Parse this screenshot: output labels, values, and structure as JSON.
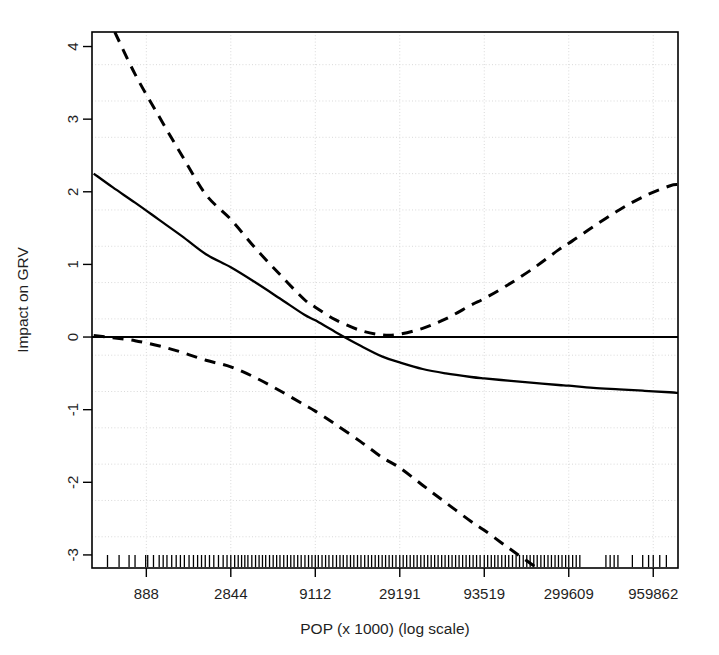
{
  "chart_data": {
    "type": "line",
    "title": "",
    "subtitle": "",
    "xlabel": "POP (x 1000) (log scale)",
    "ylabel": "Impact on GRV",
    "grid": true,
    "legend_position": "none",
    "x_scale": "log",
    "xtick_labels": [
      "888",
      "2844",
      "9112",
      "29191",
      "93519",
      "299609",
      "959862"
    ],
    "xtick_values": [
      888,
      2844,
      9112,
      29191,
      93519,
      299609,
      959862
    ],
    "ytick_labels": [
      "-3",
      "-2",
      "-1",
      "0",
      "1",
      "2",
      "3",
      "4"
    ],
    "ytick_values": [
      -3,
      -2,
      -1,
      0,
      1,
      2,
      3,
      4
    ],
    "xlim": [
      420,
      1350000
    ],
    "ylim": [
      -3.18,
      4.2
    ],
    "reference_line": {
      "orientation": "horizontal",
      "y": 0,
      "style": "solid",
      "color": "#000000"
    },
    "series": [
      {
        "name": "Smooth fit",
        "style": "solid",
        "color": "#000000",
        "x": [
          430,
          560,
          760,
          1050,
          1450,
          2020,
          2844,
          4000,
          5600,
          7800,
          9112,
          12000,
          17000,
          23000,
          29191,
          40000,
          55000,
          78000,
          93519,
          130000,
          185000,
          260000,
          299609,
          420000,
          600000,
          850000,
          1200000,
          1350000
        ],
        "y": [
          2.25,
          2.06,
          1.85,
          1.62,
          1.39,
          1.14,
          0.96,
          0.75,
          0.53,
          0.31,
          0.23,
          0.07,
          -0.12,
          -0.27,
          -0.35,
          -0.44,
          -0.5,
          -0.55,
          -0.57,
          -0.6,
          -0.63,
          -0.66,
          -0.67,
          -0.7,
          -0.72,
          -0.74,
          -0.76,
          -0.77
        ]
      },
      {
        "name": "Upper 95% confidence band",
        "style": "dashed",
        "color": "#000000",
        "x": [
          575,
          760,
          1050,
          1450,
          2020,
          2844,
          4000,
          5600,
          7800,
          9112,
          12000,
          17000,
          23000,
          29191,
          40000,
          55000,
          78000,
          93519,
          130000,
          185000,
          260000,
          299609,
          420000,
          600000,
          850000,
          1200000,
          1350000
        ],
        "y": [
          4.2,
          3.62,
          3.05,
          2.5,
          1.96,
          1.62,
          1.22,
          0.86,
          0.52,
          0.41,
          0.24,
          0.09,
          0.03,
          0.04,
          0.12,
          0.25,
          0.44,
          0.53,
          0.72,
          0.95,
          1.2,
          1.29,
          1.52,
          1.75,
          1.94,
          2.08,
          2.1
        ]
      },
      {
        "name": "Lower 95% confidence band",
        "style": "dashed",
        "color": "#000000",
        "x": [
          430,
          560,
          760,
          1050,
          1450,
          2020,
          2844,
          4000,
          5600,
          7800,
          9112,
          12000,
          17000,
          23000,
          29191,
          40000,
          55000,
          78000,
          93519,
          130000,
          185000,
          260000,
          299609,
          420000,
          600000,
          780000
        ],
        "y": [
          0.02,
          -0.01,
          -0.05,
          -0.12,
          -0.21,
          -0.32,
          -0.41,
          -0.56,
          -0.74,
          -0.93,
          -1.02,
          -1.2,
          -1.44,
          -1.66,
          -1.8,
          -2.04,
          -2.28,
          -2.54,
          -2.66,
          -2.9,
          -3.15,
          -3.4,
          -3.5,
          -3.8,
          -4.1,
          -4.3
        ]
      }
    ],
    "rug": {
      "name": "data-rug",
      "description": "tick marks showing observed POP values along the bottom axis",
      "values": [
        520,
        610,
        700,
        760,
        880,
        905,
        980,
        1060,
        1120,
        1180,
        1260,
        1340,
        1420,
        1500,
        1600,
        1700,
        1800,
        1900,
        2000,
        2120,
        2250,
        2400,
        2560,
        2700,
        2844,
        3000,
        3150,
        3300,
        3450,
        3600,
        3800,
        4000,
        4200,
        4400,
        4600,
        4850,
        5100,
        5350,
        5600,
        5900,
        6200,
        6500,
        6800,
        7150,
        7500,
        7900,
        8300,
        8700,
        9112,
        9500,
        10000,
        10500,
        11000,
        11600,
        12200,
        12800,
        13400,
        14100,
        14800,
        15500,
        16300,
        17100,
        18000,
        18900,
        19800,
        20800,
        21800,
        22900,
        24000,
        25200,
        26400,
        27700,
        29191,
        30600,
        32100,
        33700,
        35400,
        37100,
        39000,
        40900,
        42900,
        45000,
        47200,
        49500,
        52000,
        54500,
        57200,
        60000,
        63000,
        66100,
        69400,
        72800,
        76400,
        80200,
        84100,
        88300,
        93519,
        98000,
        103000,
        108000,
        113000,
        119000,
        125000,
        131000,
        138000,
        145000,
        152000,
        160000,
        168000,
        176000,
        185000,
        194000,
        204000,
        214000,
        225000,
        236000,
        248000,
        260000,
        273000,
        287000,
        299609,
        316000,
        332000,
        349000,
        500000,
        530000,
        560000,
        590000,
        720000,
        830000,
        900000,
        959862,
        1050000,
        1150000
      ]
    }
  },
  "figure": {
    "background_color": "#ffffff",
    "frame_color": "#000000",
    "grid_color": "#d9d9d9",
    "line_color": "#000000"
  }
}
